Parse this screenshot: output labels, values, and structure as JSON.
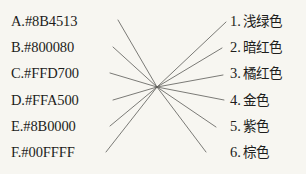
{
  "exercise": {
    "type": "matching-lines",
    "background_color": "#f7f6f1",
    "ink_color": "#1d1d1b",
    "crossing_point": {
      "x": 157,
      "y": 87
    }
  },
  "left_column": {
    "items": [
      {
        "key": "A.",
        "value": "#8B4513",
        "text": "A.#8B4513"
      },
      {
        "key": "B.",
        "value": "#800080",
        "text": "B.#800080"
      },
      {
        "key": "C.",
        "value": "#FFD700",
        "text": "C.#FFD700"
      },
      {
        "key": "D.",
        "value": "#FFA500",
        "text": "D.#FFA500"
      },
      {
        "key": "E.",
        "value": "#8B0000",
        "text": "E.#8B0000"
      },
      {
        "key": "F.",
        "value": "#00FFFF",
        "text": "F.#00FFFF"
      }
    ]
  },
  "right_column": {
    "items": [
      {
        "key": "1.",
        "label": "浅绿色"
      },
      {
        "key": "2.",
        "label": "暗红色"
      },
      {
        "key": "3.",
        "label": "橘红色"
      },
      {
        "key": "4.",
        "label": "金色"
      },
      {
        "key": "5.",
        "label": "紫色"
      },
      {
        "key": "6.",
        "label": "棕色"
      }
    ]
  },
  "connectors": [
    {
      "name": "connector-a",
      "x1": 118,
      "y1": 20,
      "x2": 226,
      "y2": 22
    },
    {
      "name": "connector-b",
      "x1": 113,
      "y1": 47,
      "x2": 222,
      "y2": 48
    },
    {
      "name": "connector-c",
      "x1": 110,
      "y1": 73,
      "x2": 223,
      "y2": 75
    },
    {
      "name": "connector-d",
      "x1": 113,
      "y1": 100,
      "x2": 224,
      "y2": 100
    },
    {
      "name": "connector-e",
      "x1": 110,
      "y1": 126,
      "x2": 216,
      "y2": 127
    },
    {
      "name": "connector-f",
      "x1": 106,
      "y1": 152,
      "x2": 206,
      "y2": 152
    }
  ]
}
